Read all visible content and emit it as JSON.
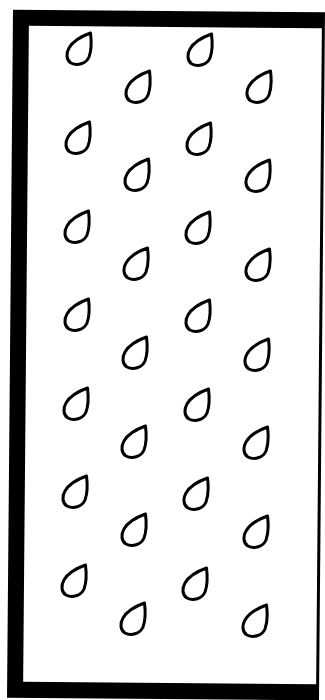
{
  "pattern": {
    "description": "Raindrop outline pattern inside a thick black frame",
    "frame_color": "#000000",
    "background_color": "#ffffff",
    "drop_stroke_color": "#000000",
    "drop_icon": "raindrop-outline-icon",
    "rows": 7,
    "drops_per_row": 4,
    "drops": [
      {
        "x": 65,
        "y": 31
      },
      {
        "x": 124,
        "y": 69
      },
      {
        "x": 186,
        "y": 32
      },
      {
        "x": 245,
        "y": 69
      },
      {
        "x": 64,
        "y": 120
      },
      {
        "x": 123,
        "y": 157
      },
      {
        "x": 185,
        "y": 121
      },
      {
        "x": 244,
        "y": 158
      },
      {
        "x": 63,
        "y": 209
      },
      {
        "x": 122,
        "y": 246
      },
      {
        "x": 184,
        "y": 210
      },
      {
        "x": 244,
        "y": 247
      },
      {
        "x": 63,
        "y": 297
      },
      {
        "x": 121,
        "y": 335
      },
      {
        "x": 184,
        "y": 298
      },
      {
        "x": 243,
        "y": 337
      },
      {
        "x": 62,
        "y": 386
      },
      {
        "x": 120,
        "y": 424
      },
      {
        "x": 183,
        "y": 387
      },
      {
        "x": 242,
        "y": 425
      },
      {
        "x": 61,
        "y": 474
      },
      {
        "x": 120,
        "y": 512
      },
      {
        "x": 182,
        "y": 476
      },
      {
        "x": 242,
        "y": 514
      },
      {
        "x": 60,
        "y": 563
      },
      {
        "x": 119,
        "y": 601
      },
      {
        "x": 181,
        "y": 566
      },
      {
        "x": 241,
        "y": 603
      }
    ]
  }
}
